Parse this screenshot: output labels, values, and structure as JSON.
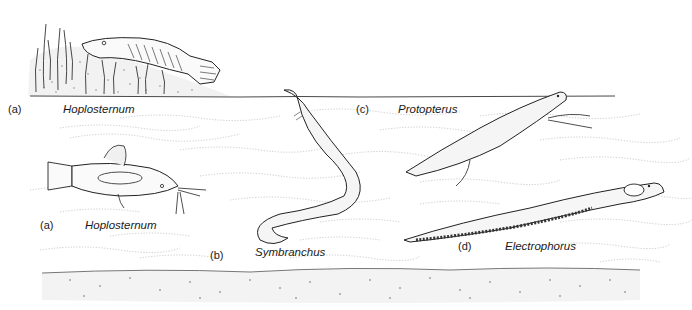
{
  "figure": {
    "background_color": "#ffffff",
    "ink_color": "#1a1a1a",
    "panels": [
      {
        "letter": "(a)",
        "name": "Hoplosternum",
        "pose": "resting on muddy bank with aquatic plants"
      },
      {
        "letter": "(a)",
        "name": "Hoplosternum",
        "pose": "swimming in water"
      },
      {
        "letter": "(b)",
        "name": "Symbranchus",
        "pose": "eel-like body reaching to surface"
      },
      {
        "letter": "(c)",
        "name": "Protopterus",
        "pose": "lungfish rising to surface"
      },
      {
        "letter": "(d)",
        "name": "Electrophorus",
        "pose": "electric eel swimming"
      }
    ],
    "scene": {
      "water_surface": "line",
      "bottom": "stippled sediment"
    }
  }
}
